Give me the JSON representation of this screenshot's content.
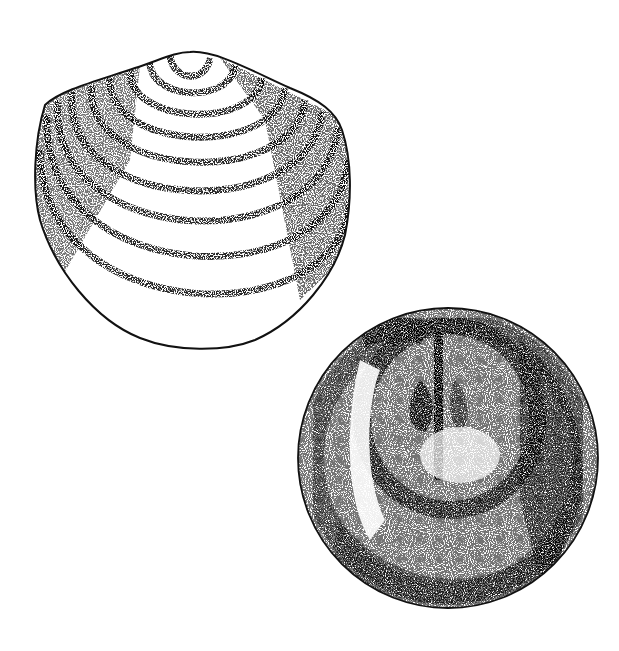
{
  "figure": {
    "kind": "stipple illustration",
    "background": "#ffffff",
    "ink": "#111111",
    "specimens": [
      {
        "name": "shell-exterior-view",
        "description": "Bivalve/brachiopod shell, exterior view with concentric growth lines",
        "growth_lines": 9
      },
      {
        "name": "shell-interior-view",
        "description": "Round valve, interior view showing muscle scars and median septum"
      }
    ]
  }
}
